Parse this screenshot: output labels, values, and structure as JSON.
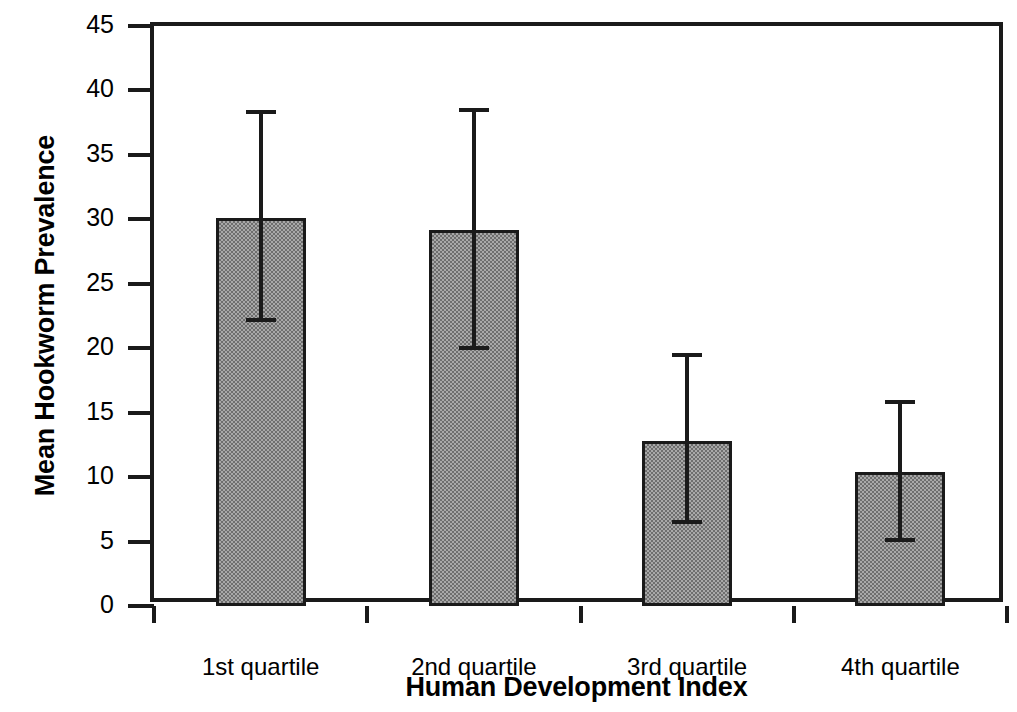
{
  "chart_data": {
    "type": "bar",
    "title": "",
    "subtitle": "",
    "xlabel": "Human Development Index",
    "ylabel": "Mean Hookworm Prevalence",
    "categories": [
      "1st quartile",
      "2nd quartile",
      "3rd quartile",
      "4th quartile"
    ],
    "values": [
      30.1,
      29.2,
      12.8,
      10.4
    ],
    "error_bars": {
      "type": "range",
      "lower": [
        22.2,
        20.0,
        6.5,
        5.1
      ],
      "upper": [
        38.3,
        38.5,
        19.5,
        15.8
      ]
    },
    "ylim": [
      0,
      45
    ],
    "ytick_values": [
      0,
      5,
      10,
      15,
      20,
      25,
      30,
      35,
      40,
      45
    ],
    "ytick_labels": [
      "0",
      "5",
      "10",
      "15",
      "20",
      "25",
      "30",
      "35",
      "40",
      "45"
    ],
    "xtick_labels": [
      "1st quartile",
      "2nd quartile",
      "3rd quartile",
      "4th quartile"
    ],
    "grid": false,
    "legend": null,
    "legend_position": "none",
    "annotations": [],
    "series": [
      {
        "name": "Mean Hookworm Prevalence",
        "values": [
          30.1,
          29.2,
          12.8,
          10.4
        ],
        "color": "#8c8c8c",
        "edge_color": "#1a1a1a"
      }
    ],
    "colors": {
      "bar_fill": "#8c8c8c",
      "bar_edge": "#1a1a1a",
      "axis": "#1a1a1a",
      "text": "#000000",
      "background": "#ffffff"
    }
  }
}
